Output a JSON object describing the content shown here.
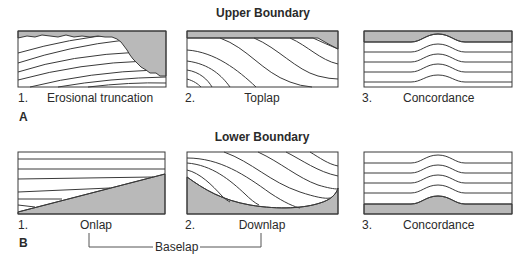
{
  "colors": {
    "fill_gray": "#b9b9b9",
    "line": "#3a3a3a",
    "background": "#ffffff"
  },
  "upper": {
    "heading": "Upper Boundary",
    "panel_letter": "A",
    "items": [
      {
        "number": "1.",
        "label": "Erosional truncation"
      },
      {
        "number": "2.",
        "label": "Toplap"
      },
      {
        "number": "3.",
        "label": "Concordance"
      }
    ]
  },
  "lower": {
    "heading": "Lower Boundary",
    "panel_letter": "B",
    "items": [
      {
        "number": "1.",
        "label": "Onlap"
      },
      {
        "number": "2.",
        "label": "Downlap"
      },
      {
        "number": "3.",
        "label": "Concordance"
      }
    ],
    "bracket_label": "Baselap"
  }
}
